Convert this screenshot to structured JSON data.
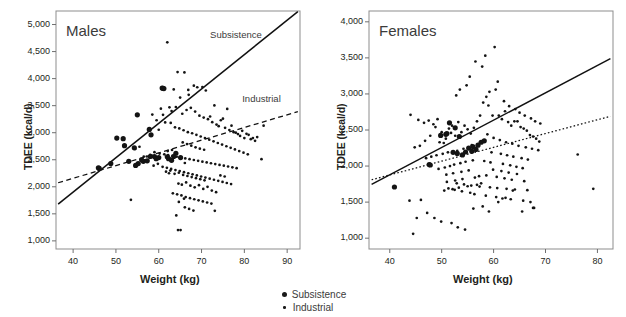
{
  "figure": {
    "legend": {
      "items": [
        {
          "label": "Subsistence",
          "marker": "large-filled-circle",
          "color": "#1a1a1a"
        },
        {
          "label": "Industrial",
          "marker": "small-filled-circle",
          "color": "#1a1a1a"
        }
      ]
    }
  },
  "chart_data": [
    {
      "type": "scatter",
      "title": "Males",
      "xlabel": "Weight (kg)",
      "ylabel": "TDEE (kcal/d)",
      "xlim": [
        36,
        93
      ],
      "ylim": [
        850,
        5250
      ],
      "xticks": [
        40,
        50,
        60,
        70,
        80,
        90
      ],
      "xticklabels": [
        "40",
        "50",
        "60",
        "70",
        "80",
        "90"
      ],
      "yticks": [
        1000,
        1500,
        2000,
        2500,
        3000,
        3500,
        4000,
        4500,
        5000
      ],
      "yticklabels": [
        "1,000",
        "1,500",
        "2,000",
        "2,500",
        "3,000",
        "3,500",
        "4,000",
        "4,500",
        "5,000"
      ],
      "grid": false,
      "annotations": [
        {
          "text": "Subsistence",
          "x": 72,
          "y": 4780
        },
        {
          "text": "Industrial",
          "x": 79.5,
          "y": 3610
        }
      ],
      "trendlines": [
        {
          "name": "Subsistence",
          "style": "solid",
          "x": [
            36.5,
            92.5
          ],
          "y": [
            1680,
            5240
          ]
        },
        {
          "name": "Industrial",
          "style": "dashed",
          "x": [
            36.5,
            92.5
          ],
          "y": [
            2075,
            3390
          ]
        }
      ],
      "series": [
        {
          "name": "Subsistence",
          "marker": "large-filled-circle",
          "x": [
            45.9,
            46.1,
            51.7,
            52.0,
            54.3,
            55.0,
            55.2,
            56.4,
            57.8,
            58.2,
            59.0,
            60.8,
            61.0,
            61.2,
            62.0,
            57.3,
            54.6,
            53.0,
            50.2,
            48.8,
            62.3,
            63.5,
            64.0,
            65.1,
            63.0,
            60.0,
            59.4,
            58.0,
            56.0
          ],
          "y": [
            2350,
            2340,
            2890,
            2760,
            2720,
            3330,
            2430,
            2470,
            3060,
            2960,
            2560,
            3825,
            3820,
            3815,
            2555,
            2480,
            2395,
            2470,
            2900,
            2430,
            2520,
            2560,
            2620,
            2540,
            2490,
            2540,
            2520,
            2560,
            2500
          ]
        },
        {
          "name": "Industrial",
          "marker": "small-filled-circle",
          "x": [
            62.0,
            64.4,
            66.0,
            66.9,
            68.2,
            63.5,
            65.0,
            67.0,
            69.0,
            70.2,
            71.0,
            72.0,
            73.0,
            74.5,
            75.0,
            76.0,
            77.0,
            78.0,
            79.5,
            80.5,
            81.0,
            82.0,
            84.0,
            84.5,
            60.5,
            61.0,
            62.5,
            63.0,
            64.0,
            65.5,
            66.5,
            67.5,
            68.5,
            69.5,
            70.5,
            71.5,
            72.5,
            73.5,
            74.0,
            75.5,
            76.5,
            77.5,
            78.5,
            79.0,
            80.0,
            81.5,
            82.5,
            83.0,
            58.5,
            59.5,
            60.0,
            61.5,
            62.8,
            63.8,
            64.8,
            65.8,
            66.8,
            67.8,
            68.8,
            69.8,
            70.8,
            71.8,
            72.8,
            73.8,
            74.8,
            75.8,
            76.8,
            77.8,
            78.8,
            79.8,
            80.8,
            53.5,
            54.5,
            55.5,
            56.5,
            57.5,
            58.0,
            59.0,
            60.2,
            61.3,
            62.2,
            63.2,
            64.2,
            65.2,
            66.2,
            67.2,
            68.2,
            69.2,
            70.2,
            71.2,
            72.2,
            73.2,
            74.2,
            75.2,
            76.2,
            77.2,
            78.2,
            56.8,
            57.2,
            58.8,
            59.8,
            60.9,
            61.9,
            62.9,
            63.9,
            64.9,
            65.9,
            66.9,
            67.9,
            68.9,
            69.9,
            70.9,
            71.9,
            72.9,
            73.9,
            74.9,
            75.9,
            76.9,
            64.6,
            65.4,
            66.4,
            67.4,
            68.4,
            69.4,
            70.4,
            71.4,
            72.4,
            73.4,
            74.4,
            75.4,
            63.3,
            64.3,
            65.3,
            66.3,
            67.3,
            68.3,
            69.3,
            70.3,
            71.3,
            72.3,
            61.7,
            62.7,
            63.7,
            64.7,
            65.7,
            66.7,
            67.7,
            68.7,
            69.7,
            70.7,
            64.1,
            65.1,
            66.1,
            67.1,
            68.1,
            62.1,
            63.1,
            65.6,
            66.6,
            67.6,
            68.6,
            69.6,
            70.6,
            64.7,
            65.9,
            73.1,
            64.5,
            62.4,
            66.1
          ],
          "y": [
            4670,
            4120,
            4115,
            3790,
            3870,
            3800,
            3650,
            3700,
            3840,
            3845,
            3780,
            3300,
            3505,
            3230,
            3260,
            3440,
            3130,
            3000,
            3035,
            2980,
            2960,
            2900,
            2510,
            3130,
            3445,
            3330,
            3470,
            3400,
            3475,
            3350,
            3420,
            3460,
            3390,
            3315,
            3280,
            3250,
            3195,
            3150,
            3120,
            3090,
            3050,
            3010,
            2975,
            2940,
            2900,
            2880,
            2850,
            2920,
            3335,
            3230,
            3055,
            3190,
            3180,
            3100,
            3080,
            3045,
            3010,
            2990,
            2960,
            2930,
            2900,
            2870,
            2840,
            2810,
            2780,
            2750,
            2720,
            2690,
            2660,
            2630,
            2600,
            1760,
            2700,
            2740,
            2560,
            2480,
            2590,
            2640,
            2615,
            2600,
            2585,
            2570,
            2555,
            2540,
            2525,
            2510,
            2495,
            2480,
            2465,
            2450,
            2435,
            2420,
            2405,
            2390,
            2375,
            2360,
            2345,
            2490,
            2560,
            2390,
            2425,
            2370,
            2350,
            2330,
            2310,
            2290,
            2270,
            2250,
            2230,
            2210,
            2190,
            2170,
            2150,
            2130,
            2110,
            2090,
            2070,
            2050,
            2060,
            2040,
            2080,
            2020,
            1990,
            2030,
            1960,
            2000,
            1930,
            1900,
            2210,
            2190,
            1880,
            1860,
            1840,
            1810,
            1790,
            1770,
            1750,
            1730,
            1710,
            1690,
            2280,
            2300,
            2240,
            2260,
            2220,
            2200,
            2180,
            2160,
            2140,
            2120,
            1470,
            1200,
            1620,
            1590,
            1560,
            2660,
            2680,
            2820,
            2790,
            2760,
            2730,
            2705,
            2685,
            1720,
            1780,
            1555,
            1200,
            2250,
            2440
          ]
        }
      ]
    },
    {
      "type": "scatter",
      "title": "Females",
      "xlabel": "Weight (kg)",
      "ylabel": "TDEE (kcal/d)",
      "xlim": [
        36,
        83
      ],
      "ylim": [
        850,
        4150
      ],
      "xticks": [
        40,
        50,
        60,
        70,
        80
      ],
      "xticklabels": [
        "40",
        "50",
        "60",
        "70",
        "80"
      ],
      "yticks": [
        1000,
        1500,
        2000,
        2500,
        3000,
        3500,
        4000
      ],
      "yticklabels": [
        "1,000",
        "1,500",
        "2,000",
        "2,500",
        "3,000",
        "3,500",
        "4,000"
      ],
      "grid": false,
      "annotations": [],
      "trendlines": [
        {
          "name": "Subsistence",
          "style": "solid",
          "x": [
            36.5,
            82.5
          ],
          "y": [
            1745,
            3490
          ]
        },
        {
          "name": "Industrial",
          "style": "dotted",
          "x": [
            36.5,
            82.5
          ],
          "y": [
            1810,
            2690
          ]
        }
      ],
      "series": [
        {
          "name": "Subsistence",
          "marker": "large-filled-circle",
          "x": [
            40.9,
            47.6,
            47.8,
            50.8,
            51.5,
            52.2,
            53.0,
            53.4,
            54.0,
            54.6,
            55.2,
            56.0,
            57.0,
            57.6,
            58.2,
            52.6,
            51.0,
            49.8,
            55.8,
            56.6
          ],
          "y": [
            1710,
            2020,
            2015,
            2440,
            2600,
            2190,
            2175,
            2410,
            2155,
            2195,
            2250,
            2270,
            2290,
            2330,
            2350,
            2530,
            2450,
            2425,
            2205,
            2230
          ]
        },
        {
          "name": "Industrial",
          "marker": "small-filled-circle",
          "x": [
            44.0,
            45.5,
            46.6,
            47.5,
            48.4,
            49.2,
            50.0,
            50.8,
            51.4,
            52.0,
            52.6,
            53.2,
            53.8,
            54.4,
            55.0,
            55.6,
            56.2,
            56.8,
            57.4,
            58.0,
            58.6,
            59.2,
            59.8,
            60.4,
            61.0,
            61.6,
            62.2,
            62.8,
            63.4,
            64.0,
            64.6,
            65.2,
            65.8,
            66.4,
            67.0,
            67.6,
            68.2,
            68.8,
            76.2,
            79.2,
            58.4,
            60.2,
            56.5,
            57.8,
            55.4,
            54.8,
            53.5,
            52.8,
            51.8,
            50.4,
            49.6,
            48.8,
            47.8,
            46.8,
            45.8,
            44.8,
            43.8,
            59.0,
            60.8,
            62.0,
            63.0,
            64.2,
            65.0,
            66.0,
            67.2,
            68.0,
            69.0,
            57.0,
            55.8,
            54.2,
            53.0,
            51.2,
            50.2,
            49.0,
            48.0,
            47.0,
            46.0,
            58.8,
            60.0,
            61.2,
            62.4,
            63.6,
            64.8,
            66.2,
            67.4,
            68.6,
            56.0,
            54.6,
            53.6,
            52.4,
            51.6,
            50.6,
            49.4,
            59.6,
            61.4,
            62.6,
            63.8,
            65.4,
            66.6,
            55.2,
            53.8,
            52.2,
            50.9,
            58.2,
            59.4,
            61.8,
            63.2,
            64.4,
            65.6,
            57.2,
            56.4,
            54.0,
            52.6,
            51.0,
            59.9,
            61.5,
            62.9,
            64.5,
            57.6,
            56.8,
            55.0,
            53.3,
            52.1,
            50.5,
            58.6,
            60.6,
            62.1,
            63.5,
            65.9,
            67.8,
            44.5,
            45.2,
            47.2,
            48.6,
            49.9,
            51.9,
            53.1,
            54.5,
            56.1,
            57.9,
            59.1,
            60.9,
            62.3,
            63.7,
            65.5,
            67.6,
            51.3,
            52.5,
            53.9,
            55.5,
            56.3,
            58.5,
            60.5,
            61.7,
            63.3,
            65.7,
            67.1,
            52.9,
            54.3,
            55.7,
            57.3,
            59.3,
            60.7,
            62.5,
            64.1,
            66.5
          ],
          "y": [
            2710,
            2640,
            2600,
            2630,
            2580,
            2650,
            2470,
            2380,
            2520,
            2560,
            2420,
            2610,
            2470,
            2560,
            2510,
            2450,
            2530,
            2620,
            2700,
            2880,
            2960,
            3030,
            2700,
            3060,
            2700,
            2650,
            2760,
            2610,
            2560,
            2620,
            2620,
            2540,
            2520,
            2490,
            2430,
            2410,
            2380,
            2340,
            2160,
            1685,
            3530,
            3650,
            3450,
            3380,
            3240,
            3120,
            3060,
            2980,
            2460,
            2320,
            2330,
            2540,
            2420,
            2350,
            2280,
            2260,
            1520,
            2840,
            3170,
            2900,
            2830,
            2790,
            2740,
            2700,
            2660,
            2620,
            2590,
            2300,
            2290,
            2240,
            2210,
            2190,
            2170,
            2150,
            2130,
            2110,
            1530,
            2440,
            2390,
            2360,
            2330,
            2310,
            2280,
            2260,
            2240,
            2220,
            2080,
            2060,
            2040,
            2020,
            2000,
            1980,
            1960,
            2190,
            2170,
            2150,
            2130,
            2110,
            2090,
            1940,
            1920,
            1900,
            1880,
            2070,
            2050,
            2030,
            2010,
            1990,
            1970,
            1860,
            1840,
            1820,
            1800,
            1780,
            1950,
            1930,
            1910,
            1890,
            1760,
            1740,
            1720,
            1700,
            1680,
            1660,
            1870,
            1850,
            1830,
            1810,
            1790,
            1420,
            1060,
            1280,
            1350,
            1280,
            1230,
            1210,
            1150,
            1120,
            1410,
            1440,
            1370,
            1500,
            1560,
            1660,
            1370,
            1420,
            1690,
            1670,
            1650,
            1630,
            1610,
            1590,
            1570,
            1550,
            1540,
            1520,
            1500,
            1760,
            1745,
            1730,
            1715,
            1705,
            1695,
            1685,
            1675,
            1665
          ]
        }
      ]
    }
  ]
}
